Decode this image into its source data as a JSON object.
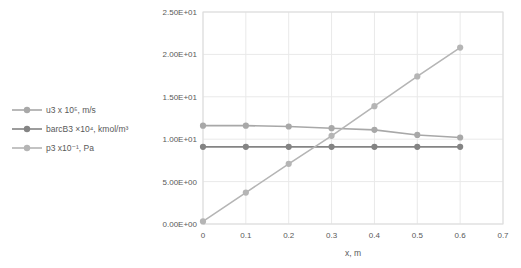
{
  "colors": {
    "series_u3": "#a8a8a8",
    "series_barcB3": "#848484",
    "series_p3": "#b5b5b5",
    "gridline": "#e9e9e9",
    "plot_border": "#dcdcdc",
    "axis_text": "#595959",
    "background": "#ffffff"
  },
  "chart_data": {
    "type": "line",
    "x": [
      0,
      0.1,
      0.2,
      0.3,
      0.4,
      0.5,
      0.6
    ],
    "series": [
      {
        "key": "u3",
        "name": "u3 x 10⁵, m/s",
        "values": [
          11.6,
          11.6,
          11.5,
          11.3,
          11.1,
          10.5,
          10.2
        ],
        "color": "#a8a8a8"
      },
      {
        "key": "barcB3",
        "name": "barcB3 ×10⁴, kmol/m³",
        "values": [
          9.1,
          9.1,
          9.1,
          9.1,
          9.1,
          9.1,
          9.1
        ],
        "color": "#848484"
      },
      {
        "key": "p3",
        "name": "p3 x10⁻¹, Pa",
        "values": [
          0.3,
          3.7,
          7.1,
          10.4,
          13.9,
          17.4,
          20.8
        ],
        "color": "#b5b5b5"
      }
    ],
    "title": "",
    "xlabel": "x, m",
    "ylabel": "",
    "xlim": [
      0,
      0.7
    ],
    "ylim": [
      0,
      25
    ],
    "xticks": [
      0,
      0.1,
      0.2,
      0.3,
      0.4,
      0.5,
      0.6,
      0.7
    ],
    "xtick_labels": [
      "0",
      "0.1",
      "0.2",
      "0.3",
      "0.4",
      "0.5",
      "0.6",
      "0.7"
    ],
    "yticks": [
      0,
      5,
      10,
      15,
      20,
      25
    ],
    "ytick_labels": [
      "0.00E+00",
      "5.00E+00",
      "1.00E+01",
      "1.50E+01",
      "2.00E+01",
      "2.50E+01"
    ],
    "grid": true,
    "legend_position": "left"
  }
}
